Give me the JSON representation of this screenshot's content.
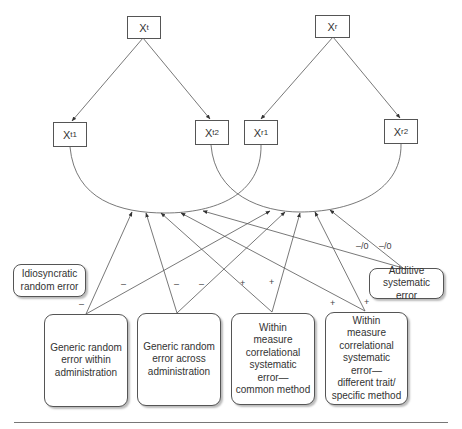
{
  "latent": {
    "xt": {
      "base": "X",
      "sub": "t"
    },
    "xr": {
      "base": "X",
      "sub": "r"
    }
  },
  "indicators": {
    "xt1": {
      "base": "X",
      "sub": "t1"
    },
    "xt2": {
      "base": "X",
      "sub": "t2"
    },
    "xr1": {
      "base": "X",
      "sub": "r1"
    },
    "xr2": {
      "base": "X",
      "sub": "r2"
    }
  },
  "error_sources": {
    "idiosyncratic": "Idiosyncratic\nrandom error",
    "additive": "Additive\nsystematic error",
    "generic_within": "Generic random\nerror within\nadministration",
    "generic_across": "Generic random\nerror across\nadministration",
    "common_method": "Within\nmeasure\ncorrelational\nsystematic\nerror—\ncommon method",
    "different_trait": "Within\nmeasure\ncorrelational\nsystematic\nerror—\ndifferent trait/\nspecific method"
  },
  "path_signs": {
    "generic_within_left": "–",
    "generic_within_right": "–",
    "generic_across_left": "–",
    "generic_across_right": "–",
    "common_method_left": "+",
    "common_method_right": "+",
    "different_trait_left": "+",
    "different_trait_right": "+",
    "additive_left": "–/0",
    "additive_right": "–/0"
  }
}
